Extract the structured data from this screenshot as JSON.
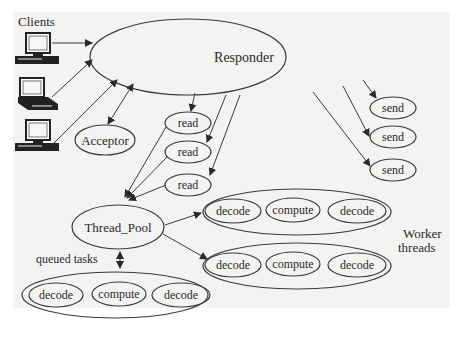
{
  "diagram": {
    "clients_label": "Clients",
    "responder_label": "Responder",
    "acceptor_label": "Acceptor",
    "read_labels": [
      "read",
      "read",
      "read"
    ],
    "send_labels": [
      "send",
      "send",
      "send"
    ],
    "thread_pool_label": "Thread_Pool",
    "queued_tasks_label": "queued tasks",
    "worker_threads_label": [
      "Worker",
      "threads"
    ],
    "queue_tasks": [
      "decode",
      "compute",
      "decode"
    ],
    "worker_row_1": [
      "decode",
      "compute",
      "decode"
    ],
    "worker_row_2": [
      "decode",
      "compute",
      "decode"
    ],
    "colors": {
      "background": "#f3f3f1",
      "stroke": "#3a3a3a",
      "text": "#2a2a2a"
    }
  }
}
